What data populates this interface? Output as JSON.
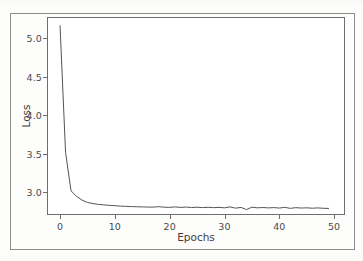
{
  "chart_data": {
    "type": "line",
    "title": "",
    "xlabel": "Epochs",
    "ylabel": "Loss",
    "xlim": [
      -2.2,
      51.8
    ],
    "ylim": [
      2.72,
      5.26
    ],
    "grid": false,
    "legend": null,
    "xticks": [
      0,
      10,
      20,
      30,
      40,
      50
    ],
    "xtick_labels": [
      "0",
      "10",
      "20",
      "30",
      "40",
      "50"
    ],
    "yticks": [
      3.0,
      3.5,
      4.0,
      4.5,
      5.0
    ],
    "ytick_labels": [
      "3.0",
      "3.5",
      "4.0",
      "4.5",
      "5.0"
    ],
    "series": [
      {
        "name": "training loss",
        "color": "#555555",
        "x": [
          0,
          1,
          2,
          3,
          4,
          5,
          6,
          7,
          8,
          9,
          10,
          11,
          12,
          13,
          14,
          15,
          16,
          17,
          18,
          19,
          20,
          21,
          22,
          23,
          24,
          25,
          26,
          27,
          28,
          29,
          30,
          31,
          32,
          33,
          34,
          35,
          36,
          37,
          38,
          39,
          40,
          41,
          42,
          43,
          44,
          45,
          46,
          47,
          48,
          49
        ],
        "values": [
          5.16,
          3.52,
          3.02,
          2.95,
          2.9,
          2.87,
          2.855,
          2.845,
          2.838,
          2.832,
          2.828,
          2.822,
          2.819,
          2.816,
          2.814,
          2.812,
          2.81,
          2.809,
          2.815,
          2.808,
          2.806,
          2.812,
          2.805,
          2.81,
          2.804,
          2.808,
          2.803,
          2.807,
          2.802,
          2.806,
          2.8,
          2.812,
          2.796,
          2.805,
          2.778,
          2.808,
          2.8,
          2.804,
          2.799,
          2.803,
          2.797,
          2.806,
          2.793,
          2.802,
          2.797,
          2.8,
          2.795,
          2.799,
          2.794,
          2.792
        ]
      }
    ]
  },
  "axes": {
    "y_label": "Loss",
    "x_label": "Epochs"
  }
}
